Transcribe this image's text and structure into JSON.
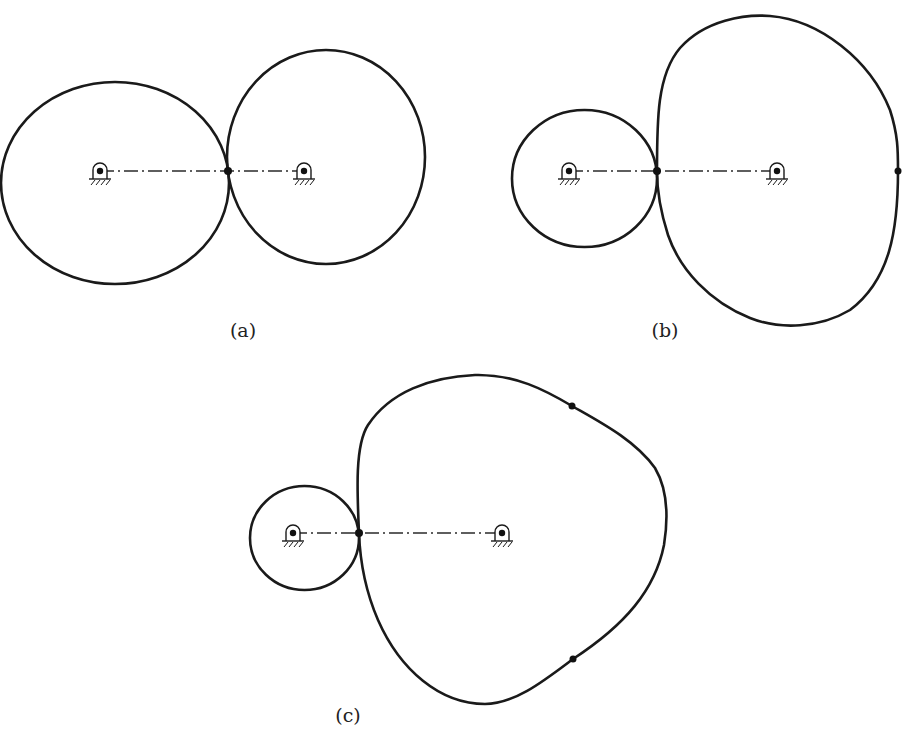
{
  "figure": {
    "panels": [
      {
        "id": "a",
        "label": "(a)",
        "description": "Two equal-sized circular (pitch) curves rolling in contact; centers joined by dash-dot line through contact point",
        "driver": {
          "pivot": [
            100,
            171
          ]
        },
        "follower": {
          "pivot": [
            304,
            171
          ]
        },
        "contact_point": [
          228,
          171
        ]
      },
      {
        "id": "b",
        "label": "(b)",
        "description": "Small circular driver with a large non-circular follower; contact point on center line, marked point on far side of follower",
        "driver": {
          "pivot": [
            569,
            171
          ]
        },
        "follower": {
          "pivot": [
            777,
            171
          ]
        },
        "contact_point": [
          657,
          171
        ],
        "marked_points": [
          [
            898,
            171
          ]
        ]
      },
      {
        "id": "c",
        "label": "(c)",
        "description": "Small circular driver with a large three-lobed non-circular follower; two marked points on follower profile",
        "driver": {
          "pivot": [
            293,
            533
          ]
        },
        "follower": {
          "pivot": [
            502,
            533
          ]
        },
        "contact_point": [
          359,
          533
        ],
        "marked_points": [
          [
            572,
            406
          ],
          [
            573,
            659
          ]
        ]
      }
    ]
  },
  "colors": {
    "stroke": "#1a1a1a",
    "background": "#ffffff"
  }
}
